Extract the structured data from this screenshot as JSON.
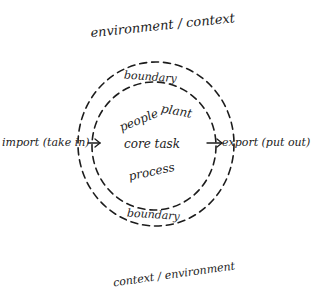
{
  "diagram": {
    "title_top": "environment / context",
    "title_bottom": "context / environment",
    "rings": {
      "outer": {
        "label_top": "boundary",
        "style": "dashed"
      },
      "inner": {
        "label_bottom": "boundary",
        "style": "dashed"
      }
    },
    "center": {
      "words": [
        "people",
        "plant",
        "core task",
        "process"
      ]
    },
    "flows": {
      "input": {
        "label": "import (take in)",
        "direction": "into boundary",
        "icon": "arrow-right-icon"
      },
      "output": {
        "label": "export (put out)",
        "direction": "out of boundary",
        "icon": "arrow-right-icon"
      }
    },
    "colors": {
      "ink": "#1c1c1c",
      "paper": "#ffffff"
    }
  }
}
